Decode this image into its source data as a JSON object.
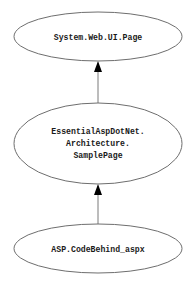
{
  "diagram": {
    "type": "inheritance-hierarchy",
    "nodes": [
      {
        "id": "page",
        "label_lines": [
          "System.Web.UI.Page"
        ]
      },
      {
        "id": "samplepage",
        "label_lines": [
          "EssentialAspDotNet.",
          "Architecture.",
          "SamplePage"
        ]
      },
      {
        "id": "codebehind",
        "label_lines": [
          "ASP.CodeBehind_aspx"
        ]
      }
    ],
    "edges": [
      {
        "from": "samplepage",
        "to": "page",
        "kind": "inherits"
      },
      {
        "from": "codebehind",
        "to": "samplepage",
        "kind": "inherits"
      }
    ],
    "colors": {
      "background": "#ffffff",
      "node_stroke": "#6e6e6e",
      "edge": "#7a7a7a",
      "arrowhead": "#000000",
      "text": "#1a1a1a"
    }
  }
}
